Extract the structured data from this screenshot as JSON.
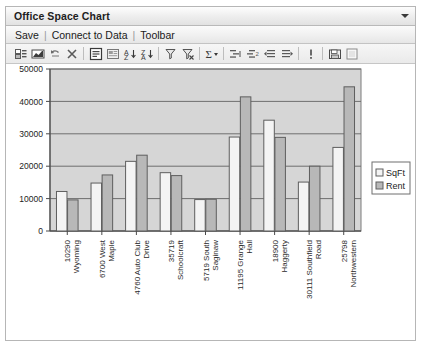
{
  "window": {
    "title": "Office Space Chart",
    "title_caret_icon": "chevron-down-icon"
  },
  "menu": {
    "items": [
      "Save",
      "Connect to Data",
      "Toolbar"
    ],
    "separator": "|"
  },
  "toolbar": {
    "buttons": [
      {
        "name": "fields-icon",
        "tip": "Fields"
      },
      {
        "name": "chart-type-icon",
        "tip": "Chart Type"
      },
      {
        "name": "undo-icon",
        "tip": "Undo"
      },
      {
        "name": "delete-icon",
        "tip": "Delete"
      },
      {
        "name": "properties-icon",
        "tip": "Properties"
      },
      {
        "name": "layout-icon",
        "tip": "Layout"
      },
      {
        "name": "sort-ascending-icon",
        "tip": "Sort Ascending"
      },
      {
        "name": "sort-descending-icon",
        "tip": "Sort Descending"
      },
      {
        "name": "filter-icon",
        "tip": "Filter"
      },
      {
        "name": "filter-remove-icon",
        "tip": "Remove Filter"
      },
      {
        "name": "sum-icon",
        "tip": "Totals"
      },
      {
        "name": "group-icon",
        "tip": "Group"
      },
      {
        "name": "ungroup-icon",
        "tip": "Ungroup"
      },
      {
        "name": "indent-left-icon",
        "tip": "Outdent"
      },
      {
        "name": "indent-right-icon",
        "tip": "Indent"
      },
      {
        "name": "info-icon",
        "tip": "Info"
      },
      {
        "name": "save-as-icon",
        "tip": "Save As"
      },
      {
        "name": "print-preview-icon",
        "tip": "Preview"
      }
    ]
  },
  "chart_data": {
    "type": "bar",
    "title": "",
    "xlabel": "",
    "ylabel": "",
    "grid": true,
    "legend_position": "right",
    "ylim": [
      0,
      50000
    ],
    "yticks": [
      "0",
      "10000",
      "20000",
      "30000",
      "40000",
      "50000"
    ],
    "ytick_values": [
      0,
      10000,
      20000,
      30000,
      40000,
      50000
    ],
    "categories": [
      "10290 Wyoming",
      "6700 West Maple",
      "4760 Auto Club Drive",
      "35719 Schoolcraft",
      "5719 South Saginaw",
      "11195 Grange Hall",
      "18900 Haggerty",
      "30111 Southfield Road",
      "25798 Northwestern"
    ],
    "series": [
      {
        "name": "SqFt",
        "color": "#f4f4f4",
        "values": [
          12200,
          14800,
          21500,
          18000,
          9700,
          29000,
          34200,
          15100,
          25800
        ]
      },
      {
        "name": "Rent",
        "color": "#b8b8b8",
        "values": [
          9600,
          17300,
          23400,
          17100,
          9800,
          41400,
          28900,
          20000,
          44500
        ]
      }
    ],
    "legend": [
      "SqFt",
      "Rent"
    ],
    "plot_background": "#d6d6d6"
  }
}
